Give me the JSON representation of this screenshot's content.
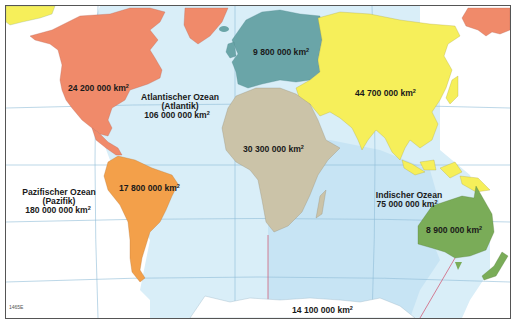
{
  "map": {
    "title": "Kontinente und Ozeane – Flächen",
    "code": "1465E",
    "colors": {
      "pacific": "#ffffff",
      "atlantic_indian": "#d9eef8",
      "indian_highlight": "#c7e4f4",
      "north_america": "#f08a6a",
      "south_america": "#f3a04a",
      "europe": "#6aa5a8",
      "asia": "#f6ef5a",
      "africa": "#cbc3a8",
      "australia": "#7aac58",
      "antarctica": "#ffffff",
      "grid": "#8fbcd6",
      "boundary": "#d0607a",
      "frame": "#555555"
    },
    "continents": [
      {
        "id": "north_america",
        "area": "24 200 000 km",
        "unit_sup": "2"
      },
      {
        "id": "south_america",
        "area": "17 800 000 km",
        "unit_sup": "2"
      },
      {
        "id": "europe",
        "area": "9 800 000 km",
        "unit_sup": "2"
      },
      {
        "id": "asia",
        "area": "44 700 000 km",
        "unit_sup": "2"
      },
      {
        "id": "africa",
        "area": "30 300 000 km",
        "unit_sup": "2"
      },
      {
        "id": "australia",
        "area": "8 900 000 km",
        "unit_sup": "2"
      },
      {
        "id": "antarctica",
        "area": "14 100 000 km",
        "unit_sup": "2"
      }
    ],
    "oceans": [
      {
        "id": "atlantic",
        "name": "Atlantischer Ozean",
        "alt": "(Atlantik)",
        "area": "106 000 000 km",
        "unit_sup": "2"
      },
      {
        "id": "pacific",
        "name": "Pazifischer Ozean",
        "alt": "(Pazifik)",
        "area": "180 000 000 km",
        "unit_sup": "2"
      },
      {
        "id": "indian",
        "name": "Indischer Ozean",
        "area": "75 000 000 km",
        "unit_sup": "2"
      }
    ]
  }
}
